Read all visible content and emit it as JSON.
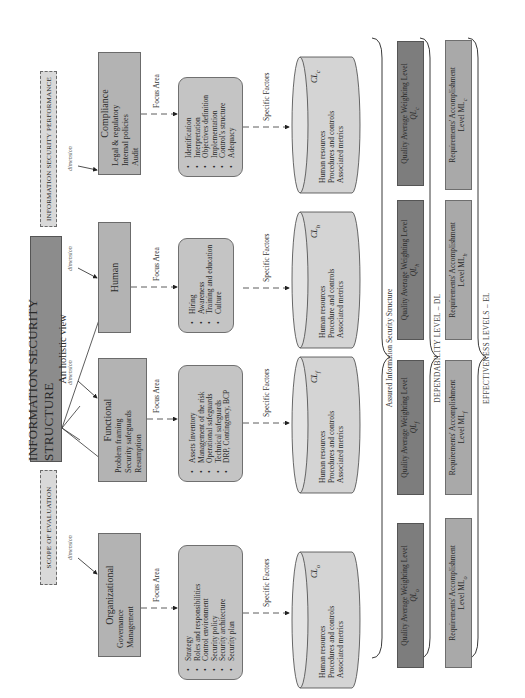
{
  "header": {
    "title": "INFORMATION SECURITY STRUCTURE",
    "subtitle": "An holistic view",
    "scope_label": "SCOPE OF EVALUATION",
    "performance_label": "INFORMATION SECURITY PERFORMANCE"
  },
  "connector_labels": {
    "dimension": "dimension",
    "focus_area": "Focus Area",
    "specific_factors": "Specific Factors"
  },
  "dimensions": [
    {
      "name": "Organizational",
      "items": [
        "Governance",
        "Management"
      ],
      "focus_items": [
        "Strategy",
        "Roles and responsibilities",
        "Control environment",
        "Security policy",
        "Security architecture",
        "Security plan"
      ],
      "factors": [
        "Human resources",
        "Procedures and controls",
        "Associated metrics"
      ],
      "cl_label": "CL",
      "cl_sub": "o",
      "quality_label": "Quality Average Weighting Level",
      "ql_label": "QL",
      "ql_sub": "o",
      "req_label": "Requirements' Accomplishment",
      "ml_label": "Level ML",
      "ml_sub": "o"
    },
    {
      "name": "Functional",
      "items": [
        "Problem framing",
        "Security safeguards",
        "Resumption"
      ],
      "focus_items": [
        "Assets Inventory",
        "Management of the risk",
        "Operational safeguards",
        "Technical safeguards",
        "DRP, Contingency, BCP"
      ],
      "factors": [
        "Human resources",
        "Procedures and controls",
        "Associated metrics"
      ],
      "cl_label": "CL",
      "cl_sub": "f",
      "quality_label": "Quality Average Weighting Level",
      "ql_label": "QL",
      "ql_sub": "f",
      "req_label": "Requirements' Accomplishment",
      "ml_label": "Level ML",
      "ml_sub": "f"
    },
    {
      "name": "Human",
      "items": [],
      "focus_items": [
        "Hiring",
        "Awareness",
        "Training and education",
        "Culture"
      ],
      "factors": [
        "Human resources",
        "Procedure and controls",
        "Associated metrics"
      ],
      "cl_label": "CL",
      "cl_sub": "h",
      "quality_label": "Quality Average Weighting Level",
      "ql_label": "QL",
      "ql_sub": "h",
      "req_label": "Requirements' Accomplishment",
      "ml_label": "Level ML",
      "ml_sub": "h"
    },
    {
      "name": "Compliance",
      "items": [
        "Legal & regulatory",
        "Internal policies",
        "Audit"
      ],
      "focus_items": [
        "Identification",
        "Interpretation",
        "Objectives definition",
        "Implementation",
        "Control's structure",
        "Adequacy"
      ],
      "factors": [
        "Human resources",
        "Procedures and controls",
        "Associated metrics"
      ],
      "cl_label": "CL",
      "cl_sub": "c",
      "quality_label": "Quality Average Weighting Level",
      "ql_label": "QL",
      "ql_sub": "c",
      "req_label": "Requirements' Accomplishment",
      "ml_label": "Level ML",
      "ml_sub": "c"
    }
  ],
  "levels": {
    "assured": "Assured Information Security Structure",
    "dependability": "DEPENDABILITY LEVEL – DL",
    "effectiveness": "EFFECTIVENESS LEVELS – EL"
  },
  "colors": {
    "title_fill": "#8c8c8c",
    "dimension_fill": "#b3b3b3",
    "focus_fill": "#c4c4c4",
    "cylinder_fill": "#d4d4d4",
    "quality_fill": "#7d7d7d",
    "requirement_fill": "#a9a9a9",
    "dashed_fill": "#d9d9d9"
  }
}
